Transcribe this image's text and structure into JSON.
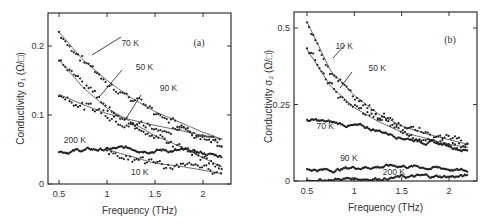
{
  "chart_data": [
    {
      "type": "line",
      "panel": "(a)",
      "title": "",
      "xlabel": "Frequency (THz)",
      "ylabel": "Conductivity σ₁ (Ω/□)",
      "xlim": [
        0.42,
        2.3
      ],
      "ylim": [
        0,
        0.25
      ],
      "xticks": [
        0.5,
        1,
        1.5,
        2
      ],
      "xtick_labels": [
        "0.5",
        "1",
        "1.5",
        "2"
      ],
      "yticks": [
        0,
        0.1,
        0.2
      ],
      "ytick_labels": [
        "0",
        "0.1",
        "0.2"
      ],
      "grid": false,
      "legend": "none (inline annotations)",
      "x": [
        0.5,
        0.75,
        1.0,
        1.25,
        1.5,
        1.75,
        2.0,
        2.2
      ],
      "series": [
        {
          "name": "70 K",
          "values": [
            0.22,
            0.18,
            0.15,
            0.125,
            0.105,
            0.09,
            0.075,
            0.065
          ],
          "style": "data points + fit"
        },
        {
          "name": "50 K",
          "values": [
            0.18,
            0.14,
            0.11,
            0.09,
            0.07,
            0.055,
            0.038,
            0.025
          ],
          "style": "data points + fit"
        },
        {
          "name": "90 K",
          "values": [
            0.13,
            0.115,
            0.102,
            0.093,
            0.085,
            0.078,
            0.07,
            0.065
          ],
          "style": "data points + fit"
        },
        {
          "name": "200 K",
          "values": [
            0.047,
            0.049,
            0.05,
            0.051,
            0.05,
            0.048,
            0.044,
            0.04
          ],
          "style": "data points"
        },
        {
          "name": "10 K",
          "values": [
            null,
            null,
            0.05,
            0.04,
            0.03,
            0.026,
            0.02,
            0.015
          ],
          "style": "data points + fit"
        }
      ],
      "annotations": [
        {
          "text": "70 K",
          "x": 1.15,
          "y": 0.2
        },
        {
          "text": "50 K",
          "x": 1.3,
          "y": 0.165
        },
        {
          "text": "90 K",
          "x": 1.55,
          "y": 0.135
        },
        {
          "text": "200 K",
          "x": 0.55,
          "y": 0.06
        },
        {
          "text": "10 K",
          "x": 1.25,
          "y": 0.013
        },
        {
          "text": "(a)",
          "x": 1.9,
          "y": 0.2
        }
      ]
    },
    {
      "type": "line",
      "panel": "(b)",
      "title": "",
      "xlabel": "Frequency (THz)",
      "ylabel": "Conductivity σ₂ (Ω/□)",
      "xlim": [
        0.42,
        2.3
      ],
      "ylim": [
        0,
        0.53
      ],
      "xticks": [
        0.5,
        1,
        1.5,
        2
      ],
      "xtick_labels": [
        "0.5",
        "1",
        "1.5",
        "2"
      ],
      "yticks": [
        0,
        0.25,
        0.5
      ],
      "ytick_labels": [
        "0",
        "0.25",
        "0.5"
      ],
      "grid": false,
      "legend": "none (inline annotations)",
      "x": [
        0.5,
        0.75,
        1.0,
        1.25,
        1.5,
        1.75,
        2.0,
        2.2
      ],
      "series": [
        {
          "name": "10 K",
          "values": [
            0.52,
            0.36,
            0.28,
            0.22,
            0.18,
            0.155,
            0.135,
            0.12
          ],
          "style": "data points + fit"
        },
        {
          "name": "50 K",
          "values": [
            0.43,
            0.31,
            0.24,
            0.195,
            0.16,
            0.14,
            0.12,
            0.11
          ],
          "style": "data points + fit"
        },
        {
          "name": "70 K",
          "values": [
            0.2,
            0.19,
            0.18,
            0.165,
            0.145,
            0.13,
            0.115,
            0.1
          ],
          "style": "data points"
        },
        {
          "name": "90 K",
          "values": [
            0.04,
            0.035,
            0.045,
            0.048,
            0.05,
            0.045,
            0.04,
            0.03
          ],
          "style": "data points"
        },
        {
          "name": "200 K",
          "values": [
            0.002,
            0.005,
            0.008,
            0.01,
            0.012,
            0.014,
            0.015,
            0.015
          ],
          "style": "data points"
        }
      ],
      "annotations": [
        {
          "text": "10 K",
          "x": 0.8,
          "y": 0.43
        },
        {
          "text": "50 K",
          "x": 1.15,
          "y": 0.36
        },
        {
          "text": "70 K",
          "x": 0.6,
          "y": 0.17
        },
        {
          "text": "90 K",
          "x": 0.85,
          "y": 0.065
        },
        {
          "text": "200 K",
          "x": 1.3,
          "y": 0.02
        },
        {
          "text": "(b)",
          "x": 1.95,
          "y": 0.45
        }
      ]
    }
  ]
}
